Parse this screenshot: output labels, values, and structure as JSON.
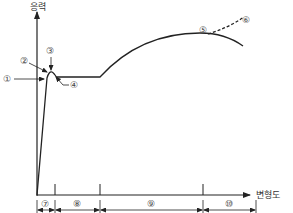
{
  "diagram": {
    "y_axis_label": "응력",
    "x_axis_label": "변형도",
    "points": {
      "p1": "①",
      "p2": "②",
      "p3": "③",
      "p4": "④",
      "p5": "⑤",
      "p6": "⑥"
    },
    "regions": {
      "r7": "⑦",
      "r8": "⑧",
      "r9": "⑨",
      "r10": "⑩"
    }
  },
  "colors": {
    "line": "#222222",
    "text": "#333333",
    "background": "#ffffff"
  }
}
